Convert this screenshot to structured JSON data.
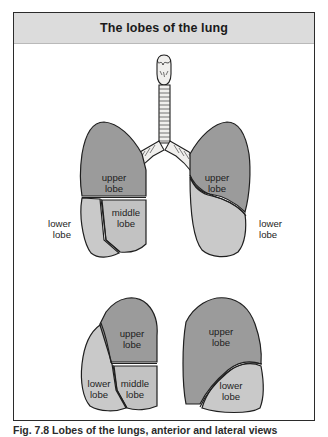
{
  "figure": {
    "title": "The lobes of the lung",
    "caption": "Fig. 7.8 Lobes of the lungs, anterior and lateral views",
    "colors": {
      "panel_border": "#2b2b2b",
      "title_band": "#dcdcdc",
      "page_background": "#ffffff",
      "upper_lobe_fill": "#9b9b9b",
      "lower_lobe_fill": "#c9c9c9",
      "middle_lobe_fill": "#c2c2c2",
      "airway_fill": "#f0efed",
      "outline": "#1f1f1f",
      "label_text": "#1d1d1d"
    }
  },
  "views": [
    {
      "name": "anterior-view",
      "structures": [
        {
          "name": "larynx",
          "label": null
        },
        {
          "name": "trachea",
          "label": null
        },
        {
          "name": "main-bronchi",
          "label": null
        },
        {
          "name": "right-lung-anterior",
          "lobes": [
            {
              "id": "upper",
              "label": "upper\nlobe",
              "line1": "upper",
              "line2": "lobe",
              "shade": "dark"
            },
            {
              "id": "middle",
              "label": "middle\nlobe",
              "line1": "middle",
              "line2": "lobe",
              "shade": "light"
            },
            {
              "id": "lower",
              "label": "lower\nlobe",
              "line1": "lower",
              "line2": "lobe",
              "shade": "light"
            }
          ]
        },
        {
          "name": "left-lung-anterior",
          "lobes": [
            {
              "id": "upper",
              "label": "upper\nlobe",
              "line1": "upper",
              "line2": "lobe",
              "shade": "dark"
            },
            {
              "id": "lower",
              "label": "lower\nlobe",
              "line1": "lower",
              "line2": "lobe",
              "shade": "light"
            }
          ]
        }
      ]
    },
    {
      "name": "lateral-views",
      "structures": [
        {
          "name": "right-lung-lateral",
          "lobes": [
            {
              "id": "upper",
              "label": "upper\nlobe",
              "line1": "upper",
              "line2": "lobe",
              "shade": "dark"
            },
            {
              "id": "middle",
              "label": "middle\nlobe",
              "line1": "middle",
              "line2": "lobe",
              "shade": "light"
            },
            {
              "id": "lower",
              "label": "lower\nlobe",
              "line1": "lower",
              "line2": "lobe",
              "shade": "light"
            }
          ]
        },
        {
          "name": "left-lung-lateral",
          "lobes": [
            {
              "id": "upper",
              "label": "upper\nlobe",
              "line1": "upper",
              "line2": "lobe",
              "shade": "dark"
            },
            {
              "id": "lower",
              "label": "lower\nlobe",
              "line1": "lower",
              "line2": "lobe",
              "shade": "light"
            }
          ]
        }
      ]
    }
  ],
  "labels": {
    "anterior_right_upper_l1": "upper",
    "anterior_right_upper_l2": "lobe",
    "anterior_right_middle_l1": "middle",
    "anterior_right_middle_l2": "lobe",
    "anterior_right_lower_l1": "lower",
    "anterior_right_lower_l2": "lobe",
    "anterior_left_upper_l1": "upper",
    "anterior_left_upper_l2": "lobe",
    "anterior_left_lower_l1": "lower",
    "anterior_left_lower_l2": "lobe",
    "lateral_right_upper_l1": "upper",
    "lateral_right_upper_l2": "lobe",
    "lateral_right_middle_l1": "middle",
    "lateral_right_middle_l2": "lobe",
    "lateral_right_lower_l1": "lower",
    "lateral_right_lower_l2": "lobe",
    "lateral_left_upper_l1": "upper",
    "lateral_left_upper_l2": "lobe",
    "lateral_left_lower_l1": "lower",
    "lateral_left_lower_l2": "lobe"
  }
}
